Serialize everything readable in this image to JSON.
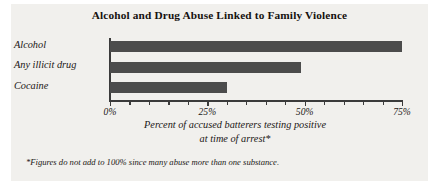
{
  "chart_data": {
    "type": "bar",
    "orientation": "horizontal",
    "title": "Alcohol and Drug Abuse Linked to Family Violence",
    "categories": [
      "Alcohol",
      "Any illicit drug",
      "Cocaine"
    ],
    "values": [
      75,
      49,
      30
    ],
    "xlabel": "Percent of accused batterers testing positive at time of arrest*",
    "ylabel": "",
    "xlim": [
      0,
      75
    ],
    "xtick_values": [
      0,
      5,
      10,
      15,
      20,
      25,
      30,
      35,
      40,
      45,
      50,
      55,
      60,
      65,
      70,
      75
    ],
    "xtick_major_values": [
      0,
      25,
      50,
      75
    ],
    "xtick_labels": [
      "0%",
      "25%",
      "50%",
      "75%"
    ],
    "grid": false,
    "legend": false,
    "bar_color": "#4c4c4c",
    "axis_color": "#3b3b3b",
    "panel_color": "#f1f0ed",
    "text_color": "#1b1715"
  },
  "caption": {
    "line1": "Percent of accused batterers testing positive",
    "line2": "at time of arrest*"
  },
  "footnote": {
    "text": "*Figures do not add to 100% since many abuse more than one substance."
  }
}
